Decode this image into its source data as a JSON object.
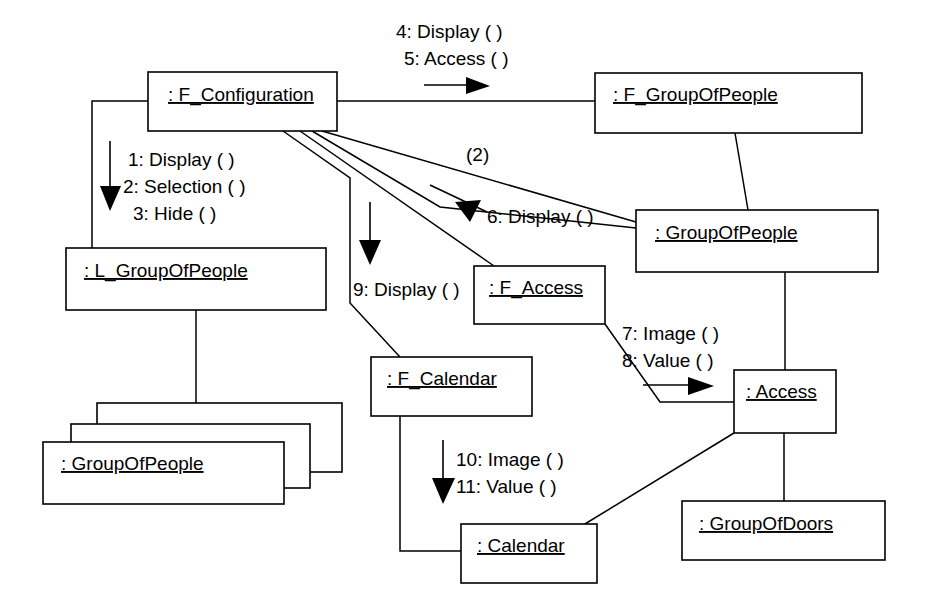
{
  "diagram": {
    "type": "uml-collaboration-diagram",
    "background_color": "#ffffff",
    "line_color": "#000000",
    "objects": [
      {
        "id": "f_configuration",
        "label": ": F_Configuration"
      },
      {
        "id": "f_groupofpeople",
        "label": ": F_GroupOfPeople"
      },
      {
        "id": "groupofpeople_r",
        "label": ": GroupOfPeople"
      },
      {
        "id": "l_groupofpeople",
        "label": ": L_GroupOfPeople"
      },
      {
        "id": "groupofpeople_multi",
        "label": ": GroupOfPeople"
      },
      {
        "id": "f_access",
        "label": ": F_Access"
      },
      {
        "id": "f_calendar",
        "label": ": F_Calendar"
      },
      {
        "id": "access",
        "label": ": Access"
      },
      {
        "id": "groupofdoors",
        "label": ": GroupOfDoors"
      },
      {
        "id": "calendar",
        "label": ": Calendar"
      }
    ],
    "messages": [
      {
        "id": "msg1",
        "text": "1: Display ( )"
      },
      {
        "id": "msg2",
        "text": "2: Selection ( )"
      },
      {
        "id": "msg3",
        "text": "3: Hide ( )"
      },
      {
        "id": "msg4",
        "text": "4: Display ( )"
      },
      {
        "id": "msg5",
        "text": "5: Access ( )"
      },
      {
        "id": "msg6",
        "text": "6: Display ( )"
      },
      {
        "id": "msg7",
        "text": "7: Image ( )"
      },
      {
        "id": "msg8",
        "text": "8: Value ( )"
      },
      {
        "id": "msg9",
        "text": "9: Display ( )"
      },
      {
        "id": "msg10",
        "text": "10: Image ( )"
      },
      {
        "id": "msg11",
        "text": "11: Value ( )"
      }
    ],
    "multiplicities": [
      {
        "id": "mult2",
        "text": "(2)"
      }
    ]
  }
}
